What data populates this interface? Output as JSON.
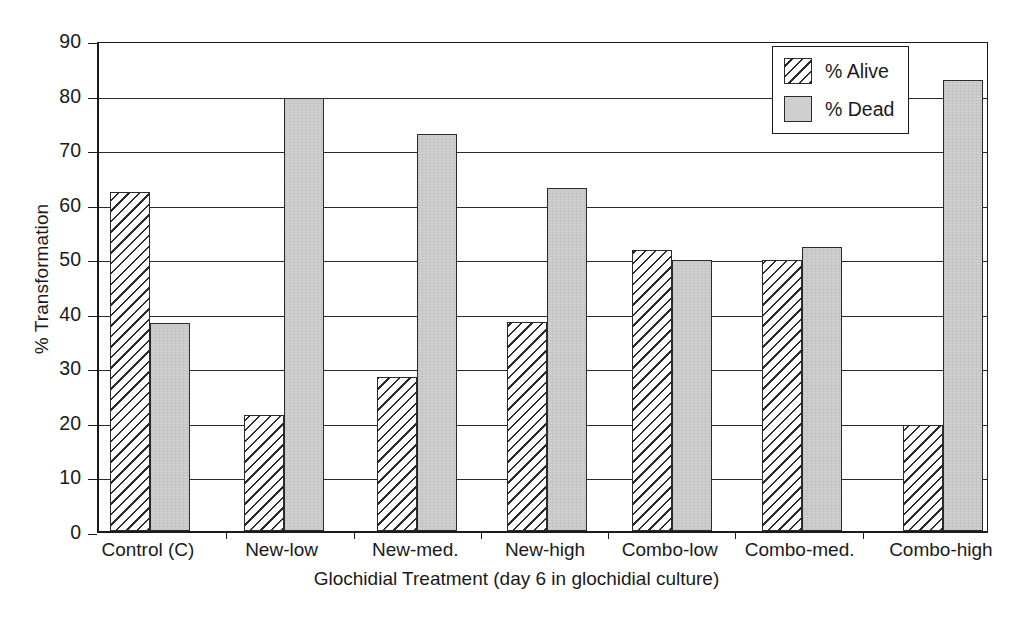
{
  "chart_data": {
    "type": "bar",
    "title": "",
    "xlabel": "Glochidial Treatment (day 6 in glochidial culture)",
    "ylabel": "% Transformation",
    "ylim": [
      0,
      90
    ],
    "ytick_step": 10,
    "yticks": [
      "0",
      "10",
      "20",
      "30",
      "40",
      "50",
      "60",
      "70",
      "80",
      "90"
    ],
    "grid": true,
    "grid_axis": "y",
    "legend_position": "top-right",
    "categories": [
      "Control (C)",
      "New-low",
      "New-med.",
      "New-high",
      "Combo-low",
      "Combo-med.",
      "Combo-high"
    ],
    "series": [
      {
        "name": "% Alive",
        "fill": "hatched",
        "color": "#ffffff",
        "values": [
          62.2,
          21.2,
          28.2,
          38.4,
          51.6,
          49.6,
          19.4
        ]
      },
      {
        "name": "% Dead",
        "fill": "solid-gray",
        "color": "#cfcfcf",
        "values": [
          38.2,
          79.4,
          72.7,
          62.8,
          49.6,
          52.0,
          82.6
        ]
      }
    ]
  },
  "legend": {
    "items": [
      {
        "label": "% Alive",
        "style": "alive"
      },
      {
        "label": "% Dead",
        "style": "dead"
      }
    ]
  },
  "colors": {
    "axis": "#1a1a1a",
    "grid": "#2a2a2a",
    "bar_outline": "#2b2b2b",
    "dead_fill": "#cfcfcf",
    "alive_fill": "#ffffff",
    "background": "#ffffff"
  }
}
